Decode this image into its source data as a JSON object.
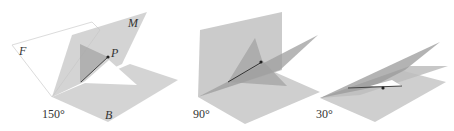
{
  "figures": [
    {
      "angle_label": "150°",
      "plane_labels": {
        "F": "F",
        "M": "M",
        "B": "B"
      },
      "point_label": "P"
    },
    {
      "angle_label": "90°"
    },
    {
      "angle_label": "30°"
    }
  ],
  "colors": {
    "plane_light": "#d4d4d4",
    "plane_mid": "#bdbdbd",
    "plane_dark": "#9a9a9a",
    "outline_light": "#e6e6e6",
    "point": "#222222"
  }
}
